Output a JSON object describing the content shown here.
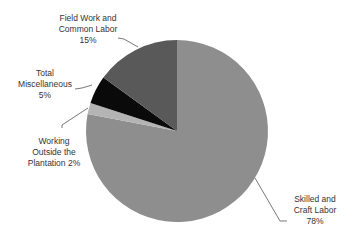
{
  "chart_data": {
    "type": "pie",
    "title": "",
    "start_angle": "12 o'clock, clockwise",
    "slices": [
      {
        "label": "Skilled and Craft Labor",
        "value": 78,
        "display": "78%",
        "color": "#8e8e8e"
      },
      {
        "label": "Working Outside the Plantation",
        "value": 2,
        "display": "2%",
        "color": "#b4b4b4"
      },
      {
        "label": "Total Miscellaneous",
        "value": 5,
        "display": "5%",
        "color": "#0a0a0a"
      },
      {
        "label": "Field Work and Common Labor",
        "value": 15,
        "display": "15%",
        "color": "#595959"
      }
    ]
  },
  "labels": {
    "field": {
      "line1": "Field Work and",
      "line2": "Common Labor",
      "line3": "15%"
    },
    "misc": {
      "line1": "Total",
      "line2": "Miscellaneous",
      "line3": "5%"
    },
    "working": {
      "line1": "Working",
      "line2": "Outside the",
      "line3": "Plantation 2%"
    },
    "skilled": {
      "line1": "Skilled and",
      "line2": "Craft Labor",
      "line3": "78%"
    }
  }
}
